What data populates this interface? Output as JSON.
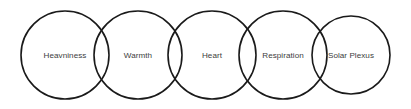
{
  "diagram": {
    "type": "overlapping-circles-chain",
    "background_color": "#ffffff",
    "stroke_color": "#1a1a1a",
    "label_color": "#3d3d3d",
    "circle_radius": 44,
    "circle_center_y": 55,
    "nodes": [
      {
        "label": "Heavniness",
        "cx": 65,
        "cy": 55,
        "r": 44
      },
      {
        "label": "Warmth",
        "cx": 138,
        "cy": 55,
        "r": 44
      },
      {
        "label": "Heart",
        "cx": 212,
        "cy": 55,
        "r": 44
      },
      {
        "label": "Respiration",
        "cx": 283,
        "cy": 55,
        "r": 44
      },
      {
        "label": "Solar Plexus",
        "cx": 351,
        "cy": 55,
        "r": 39
      }
    ]
  }
}
